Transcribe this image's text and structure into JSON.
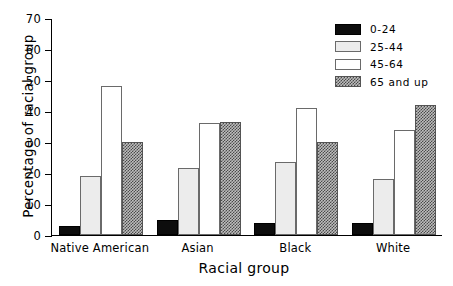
{
  "chart_data": {
    "type": "bar",
    "title": "",
    "xlabel": "Racial group",
    "ylabel": "Percentage of racial group",
    "categories": [
      "Native American",
      "Asian",
      "Black",
      "White"
    ],
    "series": [
      {
        "name": "0-24",
        "values": [
          3,
          5,
          4,
          4
        ]
      },
      {
        "name": "25-44",
        "values": [
          19,
          21.5,
          23.5,
          18
        ]
      },
      {
        "name": "45-64",
        "values": [
          48,
          36,
          41,
          34
        ]
      },
      {
        "name": "65 and up",
        "values": [
          30,
          36.5,
          30,
          42
        ]
      }
    ],
    "ylim": [
      0,
      70
    ],
    "yticks": [
      0,
      10,
      20,
      30,
      40,
      50,
      60,
      70
    ],
    "ytick_labels": [
      "0",
      "10",
      "20",
      "30",
      "40",
      "50",
      "60",
      "70"
    ],
    "grid": false,
    "legend_position": "top-right",
    "legend_entries": [
      {
        "label": "0-24",
        "swatch": "solid-black",
        "color": "#0d0d0d"
      },
      {
        "label": "25-44",
        "swatch": "light-gray",
        "color": "#ececec"
      },
      {
        "label": "45-64",
        "swatch": "white",
        "color": "#ffffff"
      },
      {
        "label": "65 and up",
        "swatch": "checkered",
        "color": "#808080"
      }
    ]
  }
}
